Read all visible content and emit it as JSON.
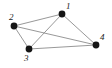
{
  "figure": {
    "kind": "undirected-graph-diagram",
    "width": 112,
    "height": 68,
    "background_color": "#ffffff",
    "edge_color": "#8c8c8c",
    "node_color": "#151515",
    "label_color": "#1a1a1a"
  },
  "chart_data": {
    "type": "diagram",
    "title": "",
    "xlabel": "",
    "ylabel": "",
    "graph_type": "undirected",
    "node_count": 4,
    "edge_count": 6,
    "nodes": [
      {
        "id": "1",
        "label": "1",
        "x": 62,
        "y": 14,
        "r": 3.4,
        "label_x": 66,
        "label_y": 2
      },
      {
        "id": "2",
        "label": "2",
        "x": 14,
        "y": 26,
        "r": 3.4,
        "label_x": 9,
        "label_y": 13
      },
      {
        "id": "3",
        "label": "3",
        "x": 29,
        "y": 49,
        "r": 3.4,
        "label_x": 24,
        "label_y": 54
      },
      {
        "id": "4",
        "label": "4",
        "x": 96,
        "y": 45,
        "r": 3.4,
        "label_x": 100,
        "label_y": 33
      }
    ],
    "edges": [
      {
        "source": "1",
        "target": "2"
      },
      {
        "source": "1",
        "target": "3"
      },
      {
        "source": "1",
        "target": "4"
      },
      {
        "source": "2",
        "target": "3"
      },
      {
        "source": "2",
        "target": "4"
      },
      {
        "source": "3",
        "target": "4"
      }
    ]
  }
}
